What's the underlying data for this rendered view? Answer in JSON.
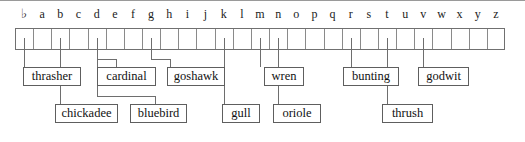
{
  "diagram": {
    "array": {
      "cell_count": 27,
      "index_labels": [
        "♭",
        "a",
        "b",
        "c",
        "d",
        "e",
        "f",
        "g",
        "h",
        "i",
        "j",
        "k",
        "l",
        "m",
        "n",
        "o",
        "p",
        "q",
        "r",
        "s",
        "t",
        "u",
        "v",
        "w",
        "x",
        "y",
        "z"
      ],
      "cells_filled": [],
      "border_color": "#707070",
      "divider_color": "#8a8a8a"
    },
    "connector_color": "#6e6e6e",
    "labels": [
      {
        "name": "thrasher",
        "text": "thrasher",
        "index_letter": "a",
        "index": 1,
        "row": 1,
        "box_x": 23,
        "box_y": 67,
        "box_w": 58,
        "stub_x": 34,
        "bend": false
      },
      {
        "name": "cardinal",
        "text": "cardinal",
        "index_letter": "e",
        "index": 5,
        "row": 1,
        "box_x": 97,
        "box_y": 67,
        "box_w": 59,
        "stub_x": 116,
        "bend": true
      },
      {
        "name": "goshawk",
        "text": "goshawk",
        "index_letter": "h",
        "index": 8,
        "row": 1,
        "box_x": 167,
        "box_y": 67,
        "box_w": 58,
        "stub_x": 170,
        "bend": true
      },
      {
        "name": "wren",
        "text": "wren",
        "index_letter": "n",
        "index": 14,
        "row": 1,
        "box_x": 264,
        "box_y": 67,
        "box_w": 40,
        "stub_x": 285,
        "bend": false
      },
      {
        "name": "bunting",
        "text": "bunting",
        "index_letter": "s",
        "index": 19,
        "row": 1,
        "box_x": 343,
        "box_y": 67,
        "box_w": 56,
        "stub_x": 373,
        "bend": false
      },
      {
        "name": "godwit",
        "text": "godwit",
        "index_letter": "w",
        "index": 23,
        "row": 1,
        "box_x": 418,
        "box_y": 67,
        "box_w": 51,
        "stub_x": 442,
        "bend": false
      },
      {
        "name": "chickadee",
        "text": "chickadee",
        "index_letter": "c",
        "index": 3,
        "row": 2,
        "box_x": 55,
        "box_y": 104,
        "box_w": 63,
        "stub_x": 83,
        "bend": false
      },
      {
        "name": "bluebird",
        "text": "bluebird",
        "index_letter": "e",
        "index": 5,
        "row": 2,
        "box_x": 130,
        "box_y": 104,
        "box_w": 57,
        "stub_x": 155,
        "bend": true
      },
      {
        "name": "gull",
        "text": "gull",
        "index_letter": "l",
        "index": 12,
        "row": 2,
        "box_x": 222,
        "box_y": 104,
        "box_w": 38,
        "stub_x": 241,
        "bend": false
      },
      {
        "name": "oriole",
        "text": "oriole",
        "index_letter": "o",
        "index": 15,
        "row": 2,
        "box_x": 273,
        "box_y": 104,
        "box_w": 48,
        "stub_x": 303,
        "bend": false
      },
      {
        "name": "thrush",
        "text": "thrush",
        "index_letter": "u",
        "index": 21,
        "row": 2,
        "box_x": 382,
        "box_y": 104,
        "box_w": 51,
        "stub_x": 407,
        "bend": false
      }
    ]
  }
}
